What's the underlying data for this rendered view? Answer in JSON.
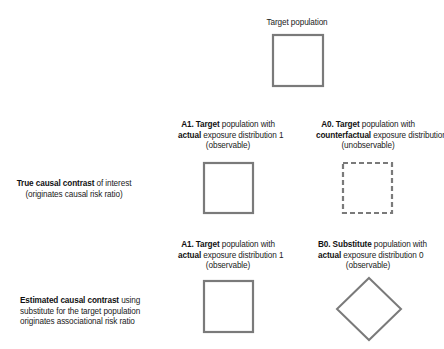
{
  "diagram": {
    "target": {
      "label": "Target population"
    },
    "rows": [
      {
        "row_label_bold": "True causal contrast",
        "row_label_rest": " of interest",
        "row_label_line2": "(originates causal risk ratio)",
        "left": {
          "bold": "A1. Target",
          "rest": " population with",
          "line2_bold": "actual",
          "line2_rest": " exposure distribution 1",
          "line3": "(observable)",
          "shape": "square-solid"
        },
        "right": {
          "bold": "A0. Target",
          "rest": " population with",
          "line2_bold": "counterfactual",
          "line2_rest": " exposure distribution 0",
          "line3": "(unobservable)",
          "shape": "square-dashed"
        }
      },
      {
        "row_label_bold": "Estimated causal contrast",
        "row_label_rest": " using",
        "row_label_line2": "substitute for the target population",
        "row_label_line3": "originates associational risk ratio",
        "left": {
          "bold": "A1. Target",
          "rest": " population with",
          "line2_bold": "actual",
          "line2_rest": " exposure distribution 1",
          "line3": "(observable)",
          "shape": "square-solid"
        },
        "right": {
          "bold": "B0. Substitute",
          "rest": " population with",
          "line2_bold": "actual",
          "line2_rest": " exposure distribution 0",
          "line3": "(observable)",
          "shape": "diamond"
        }
      }
    ],
    "colors": {
      "stroke": "#7a7a7a",
      "text": "#222222"
    }
  }
}
